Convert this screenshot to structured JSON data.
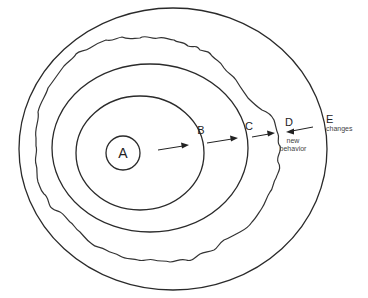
{
  "diagram": {
    "type": "nested-circles",
    "labels": {
      "a": "A",
      "b": "B",
      "c": "C",
      "d": "D",
      "e": "E"
    },
    "annotations": {
      "e_note": "changes",
      "d_note_line1": "new",
      "d_note_line2": "behavior"
    },
    "arrows": [
      {
        "from": "A",
        "to": "B",
        "direction": "outward"
      },
      {
        "from": "B",
        "to": "C",
        "direction": "outward"
      },
      {
        "from": "C",
        "to": "D",
        "direction": "outward"
      },
      {
        "from": "E",
        "to": "D",
        "direction": "inward"
      }
    ],
    "colors": {
      "line": "#2a2a2a",
      "background": "#ffffff"
    }
  }
}
